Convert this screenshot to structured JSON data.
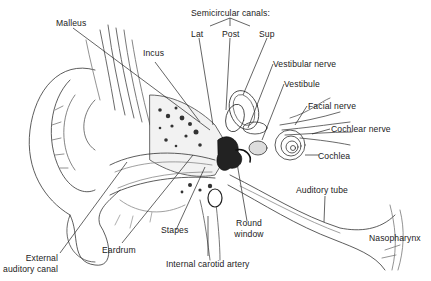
{
  "diagram": {
    "group_label": "Semicircular canals:",
    "labels": {
      "malleus": "Malleus",
      "incus": "Incus",
      "lat": "Lat",
      "post": "Post",
      "sup": "Sup",
      "vestibular_nerve": "Vestibular nerve",
      "vestibule": "Vestibule",
      "facial_nerve": "Facial nerve",
      "cochlear_nerve": "Cochlear nerve",
      "cochlea": "Cochlea",
      "auditory_tube": "Auditory tube",
      "nasopharynx": "Nasopharynx",
      "round_window_1": "Round",
      "round_window_2": "window",
      "internal_carotid_artery": "Internal carotid artery",
      "stapes": "Stapes",
      "eardrum": "Eardrum",
      "external_auditory_canal_1": "External",
      "external_auditory_canal_2": "auditory canal"
    },
    "colors": {
      "ink": "#222222",
      "background": "#ffffff",
      "bone_fill": "#f4f4f4"
    }
  }
}
